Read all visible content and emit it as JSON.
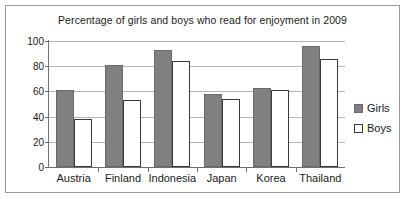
{
  "chart_data": {
    "type": "bar",
    "title": "Percentage of girls and boys who read for enjoyment in 2009",
    "xlabel": "",
    "ylabel": "",
    "ylim": [
      0,
      100
    ],
    "yticks": [
      0,
      20,
      40,
      60,
      80,
      100
    ],
    "grid": true,
    "legend_position": "right",
    "categories": [
      "Austria",
      "Finland",
      "Indonesia",
      "Japan",
      "Korea",
      "Thailand"
    ],
    "series": [
      {
        "name": "Girls",
        "color": "#808080",
        "values": [
          61,
          81,
          93,
          58,
          63,
          96
        ]
      },
      {
        "name": "Boys",
        "color": "#ffffff",
        "values": [
          38,
          53,
          84,
          54,
          61,
          86
        ]
      }
    ]
  }
}
